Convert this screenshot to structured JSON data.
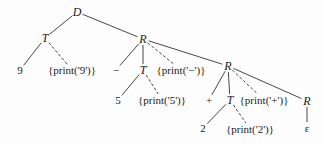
{
  "diagram": {
    "type": "annotated parse tree",
    "nodes": [
      {
        "id": "D",
        "label": "D",
        "x": 77,
        "y": 12,
        "kind": "nonterminal"
      },
      {
        "id": "T1",
        "label": "T",
        "x": 45,
        "y": 38,
        "kind": "nonterminal"
      },
      {
        "id": "n9",
        "label": "9",
        "x": 20,
        "y": 70,
        "kind": "terminal"
      },
      {
        "id": "a9",
        "label": "{print('9')}",
        "x": 72,
        "y": 70,
        "kind": "action"
      },
      {
        "id": "R1",
        "label": "R",
        "x": 143,
        "y": 39,
        "kind": "nonterminal"
      },
      {
        "id": "minus",
        "label": "−",
        "x": 116,
        "y": 70,
        "kind": "terminal"
      },
      {
        "id": "T2",
        "label": "T",
        "x": 143,
        "y": 70,
        "kind": "nonterminal"
      },
      {
        "id": "aminus",
        "label": "{print('−')}",
        "x": 181,
        "y": 70,
        "kind": "action"
      },
      {
        "id": "n5",
        "label": "5",
        "x": 118,
        "y": 100,
        "kind": "terminal"
      },
      {
        "id": "a5",
        "label": "{print('5')}",
        "x": 162,
        "y": 100,
        "kind": "action"
      },
      {
        "id": "R2",
        "label": "R",
        "x": 228,
        "y": 66,
        "kind": "nonterminal"
      },
      {
        "id": "plus",
        "label": "+",
        "x": 209,
        "y": 100,
        "kind": "terminal"
      },
      {
        "id": "T3",
        "label": "T",
        "x": 230,
        "y": 100,
        "kind": "nonterminal"
      },
      {
        "id": "aplus",
        "label": "{print('+')}",
        "x": 264,
        "y": 100,
        "kind": "action"
      },
      {
        "id": "n2",
        "label": "2",
        "x": 203,
        "y": 128,
        "kind": "terminal"
      },
      {
        "id": "a2",
        "label": "{print('2')}",
        "x": 250,
        "y": 129,
        "kind": "action"
      },
      {
        "id": "R3",
        "label": "R",
        "x": 307,
        "y": 101,
        "kind": "nonterminal"
      },
      {
        "id": "eps",
        "label": "ε",
        "x": 307,
        "y": 128,
        "kind": "terminal"
      }
    ],
    "edges": [
      {
        "from": "D",
        "to": "T1",
        "style": "solid"
      },
      {
        "from": "D",
        "to": "R1",
        "style": "solid"
      },
      {
        "from": "T1",
        "to": "n9",
        "style": "solid"
      },
      {
        "from": "T1",
        "to": "a9",
        "style": "dashed"
      },
      {
        "from": "R1",
        "to": "minus",
        "style": "solid"
      },
      {
        "from": "R1",
        "to": "T2",
        "style": "solid"
      },
      {
        "from": "R1",
        "to": "aminus",
        "style": "dashed"
      },
      {
        "from": "R1",
        "to": "R2",
        "style": "solid"
      },
      {
        "from": "T2",
        "to": "n5",
        "style": "solid"
      },
      {
        "from": "T2",
        "to": "a5",
        "style": "dashed"
      },
      {
        "from": "R2",
        "to": "plus",
        "style": "solid"
      },
      {
        "from": "R2",
        "to": "T3",
        "style": "solid"
      },
      {
        "from": "R2",
        "to": "aplus",
        "style": "dashed"
      },
      {
        "from": "R2",
        "to": "R3",
        "style": "solid"
      },
      {
        "from": "T3",
        "to": "n2",
        "style": "solid"
      },
      {
        "from": "T3",
        "to": "a2",
        "style": "dashed"
      },
      {
        "from": "R3",
        "to": "eps",
        "style": "solid"
      }
    ]
  }
}
